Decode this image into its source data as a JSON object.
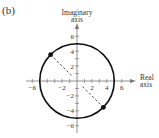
{
  "panel_label": "(b)",
  "axes": {
    "x_label_line1": "Real",
    "x_label_line2": "axis",
    "y_label_line1": "Imaginary",
    "y_label_line2": "axis",
    "x_ticks": [
      {
        "value": -6,
        "label": "−6"
      },
      {
        "value": -2,
        "label": "−2"
      },
      {
        "value": 2,
        "label": "2"
      },
      {
        "value": 4,
        "label": "4"
      },
      {
        "value": 6,
        "label": "6"
      }
    ],
    "y_ticks": [
      {
        "value": 6,
        "label": "6"
      },
      {
        "value": 4,
        "label": "4"
      },
      {
        "value": 2,
        "label": "2"
      },
      {
        "value": -2,
        "label": "−2"
      },
      {
        "value": -4,
        "label": "−4"
      },
      {
        "value": -6,
        "label": "−6"
      }
    ]
  },
  "circle": {
    "center": [
      0,
      0
    ],
    "radius": 5,
    "color": "#111111"
  },
  "points": [
    {
      "x": -3.54,
      "y": 3.54
    },
    {
      "x": 3.54,
      "y": -3.54
    }
  ],
  "colors": {
    "axis": "#777777",
    "dash": "#555555",
    "point": "#111111"
  }
}
